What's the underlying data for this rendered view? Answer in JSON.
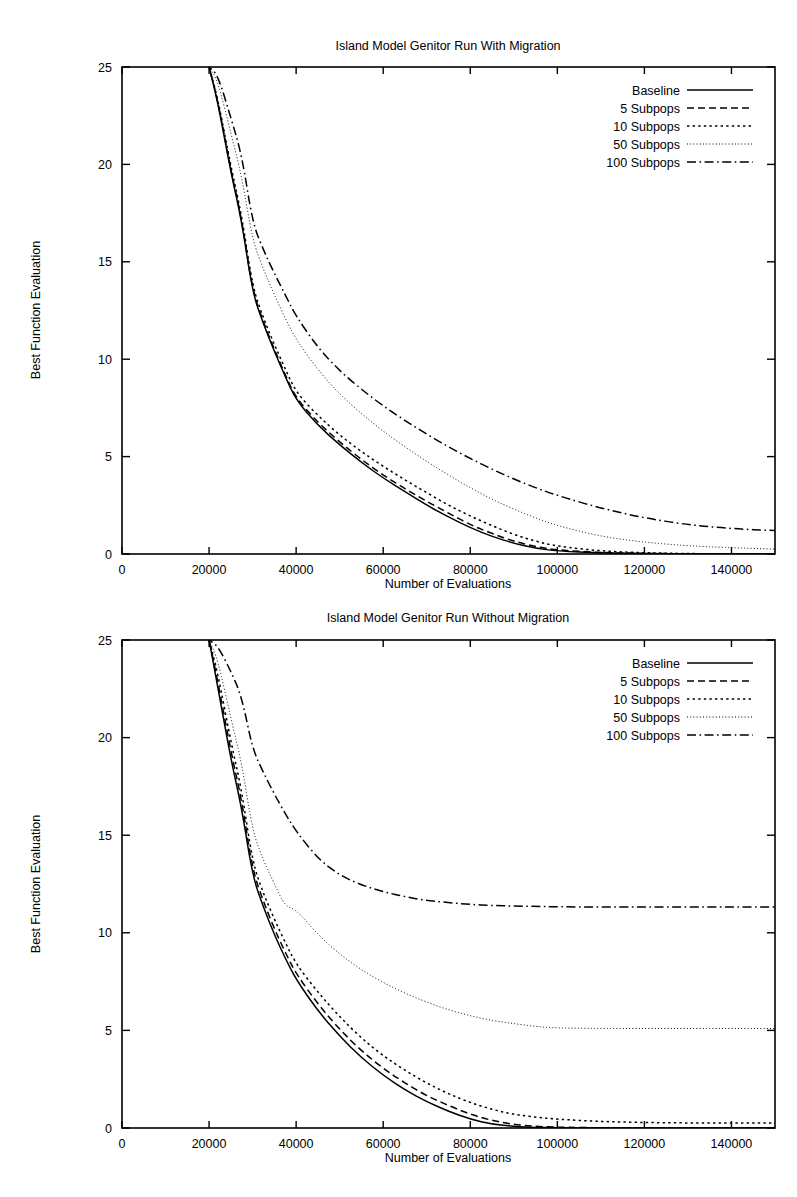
{
  "figures": [
    {
      "id": "figure-1",
      "title": "Island Model Genitor Run With Migration",
      "xlabel": "Number of Evaluations",
      "ylabel": "Best Function Evaluation"
    },
    {
      "id": "figure-2",
      "title": "Island Model Genitor Run Without Migration",
      "xlabel": "Number of Evaluations",
      "ylabel": "Best Function Evaluation"
    }
  ],
  "axis": {
    "x_ticks": [
      "0",
      "20000",
      "40000",
      "60000",
      "80000",
      "100000",
      "120000",
      "140000"
    ],
    "y_ticks": [
      "0",
      "5",
      "10",
      "15",
      "20",
      "25"
    ],
    "xlim": [
      0,
      150000
    ],
    "ylim": [
      0,
      25
    ]
  },
  "legend": {
    "position": "top-right-inside",
    "items": [
      {
        "label": "Baseline",
        "style": "solid"
      },
      {
        "label": "5 Subpops",
        "style": "dashed"
      },
      {
        "label": "10 Subpops",
        "style": "dotted"
      },
      {
        "label": "50 Subpops",
        "style": "fine-dotted"
      },
      {
        "label": "100 Subpops",
        "style": "dash-dot"
      }
    ]
  },
  "colors": {
    "ink": "#000000",
    "background": "#ffffff"
  },
  "chart_data": [
    {
      "type": "line",
      "title": "Island Model Genitor Run With Migration",
      "xlabel": "Number of Evaluations",
      "ylabel": "Best Function Evaluation",
      "xlim": [
        0,
        150000
      ],
      "ylim": [
        0,
        25
      ],
      "grid": false,
      "legend": "upper right",
      "x": [
        20000,
        22000,
        25000,
        27500,
        30000,
        32500,
        35000,
        37500,
        40000,
        45000,
        50000,
        55000,
        60000,
        65000,
        70000,
        75000,
        80000,
        85000,
        90000,
        95000,
        100000,
        110000,
        120000,
        130000,
        140000,
        150000
      ],
      "series": [
        {
          "name": "Baseline",
          "style": "solid",
          "values": [
            25.0,
            23.2,
            19.6,
            17.1,
            13.4,
            11.8,
            10.4,
            9.1,
            7.9,
            6.6,
            5.6,
            4.7,
            3.9,
            3.2,
            2.5,
            1.9,
            1.35,
            0.9,
            0.55,
            0.3,
            0.15,
            0.05,
            0.02,
            0.01,
            0.0,
            0.0
          ]
        },
        {
          "name": "5 Subpops",
          "style": "dashed",
          "values": [
            25.0,
            23.3,
            19.7,
            17.2,
            13.5,
            11.9,
            10.5,
            9.2,
            8.0,
            6.75,
            5.75,
            4.85,
            4.05,
            3.35,
            2.7,
            2.1,
            1.5,
            1.05,
            0.65,
            0.38,
            0.2,
            0.07,
            0.03,
            0.01,
            0.0,
            0.0
          ]
        },
        {
          "name": "10 Subpops",
          "style": "dotted",
          "values": [
            25.0,
            23.4,
            19.9,
            17.4,
            13.7,
            12.1,
            10.75,
            9.5,
            8.3,
            7.1,
            6.1,
            5.25,
            4.5,
            3.8,
            3.15,
            2.5,
            1.95,
            1.45,
            1.0,
            0.65,
            0.4,
            0.15,
            0.06,
            0.02,
            0.01,
            0.0
          ]
        },
        {
          "name": "50 Subpops",
          "style": "fine-dotted",
          "values": [
            25.0,
            24.3,
            21.6,
            19.4,
            16.1,
            14.6,
            13.3,
            12.1,
            11.0,
            9.45,
            8.2,
            7.2,
            6.3,
            5.5,
            4.75,
            4.05,
            3.4,
            2.8,
            2.3,
            1.85,
            1.45,
            0.9,
            0.6,
            0.42,
            0.32,
            0.25
          ]
        },
        {
          "name": "100 Subpops",
          "style": "dash-dot",
          "values": [
            25.0,
            24.6,
            22.4,
            20.5,
            17.0,
            15.6,
            14.4,
            13.3,
            12.2,
            10.6,
            9.4,
            8.45,
            7.6,
            6.85,
            6.15,
            5.5,
            4.9,
            4.35,
            3.85,
            3.4,
            3.0,
            2.35,
            1.85,
            1.5,
            1.3,
            1.2
          ]
        }
      ]
    },
    {
      "type": "line",
      "title": "Island Model Genitor Run Without Migration",
      "xlabel": "Number of Evaluations",
      "ylabel": "Best Function Evaluation",
      "xlim": [
        0,
        150000
      ],
      "ylim": [
        0,
        25
      ],
      "grid": false,
      "legend": "upper right",
      "x": [
        20000,
        22000,
        25000,
        27500,
        30000,
        32500,
        35000,
        37500,
        40000,
        45000,
        50000,
        55000,
        60000,
        65000,
        70000,
        75000,
        80000,
        85000,
        90000,
        95000,
        100000,
        110000,
        120000,
        130000,
        140000,
        150000
      ],
      "series": [
        {
          "name": "Baseline",
          "style": "solid",
          "values": [
            25.0,
            22.6,
            18.9,
            16.4,
            12.9,
            11.3,
            9.9,
            8.7,
            7.6,
            6.0,
            4.7,
            3.6,
            2.7,
            1.95,
            1.35,
            0.85,
            0.45,
            0.2,
            0.08,
            0.03,
            0.01,
            0.0,
            0.0,
            0.0,
            0.0,
            0.0
          ]
        },
        {
          "name": "5 Subpops",
          "style": "dashed",
          "values": [
            25.0,
            22.9,
            19.3,
            16.8,
            13.2,
            11.6,
            10.2,
            9.0,
            7.9,
            6.35,
            5.05,
            3.95,
            3.05,
            2.3,
            1.65,
            1.15,
            0.7,
            0.38,
            0.18,
            0.08,
            0.04,
            0.01,
            0.0,
            0.0,
            0.0,
            0.0
          ]
        },
        {
          "name": "10 Subpops",
          "style": "dotted",
          "values": [
            25.0,
            23.3,
            19.8,
            17.3,
            13.6,
            12.0,
            10.7,
            9.5,
            8.4,
            6.95,
            5.7,
            4.6,
            3.7,
            2.95,
            2.3,
            1.75,
            1.3,
            0.95,
            0.7,
            0.55,
            0.45,
            0.33,
            0.28,
            0.26,
            0.25,
            0.25
          ]
        },
        {
          "name": "50 Subpops",
          "style": "fine-dotted",
          "values": [
            25.0,
            24.0,
            21.0,
            18.7,
            15.2,
            13.7,
            12.5,
            11.35,
            11.2,
            9.9,
            8.9,
            8.1,
            7.45,
            6.9,
            6.45,
            6.05,
            5.75,
            5.5,
            5.35,
            5.2,
            5.12,
            5.1,
            5.1,
            5.1,
            5.1,
            5.1
          ]
        },
        {
          "name": "100 Subpops",
          "style": "dash-dot",
          "values": [
            25.0,
            24.7,
            23.4,
            22.1,
            19.4,
            18.2,
            17.1,
            16.1,
            15.2,
            13.8,
            12.95,
            12.45,
            12.1,
            11.85,
            11.65,
            11.55,
            11.45,
            11.4,
            11.37,
            11.35,
            11.33,
            11.32,
            11.32,
            11.32,
            11.32,
            11.32
          ]
        }
      ]
    }
  ]
}
